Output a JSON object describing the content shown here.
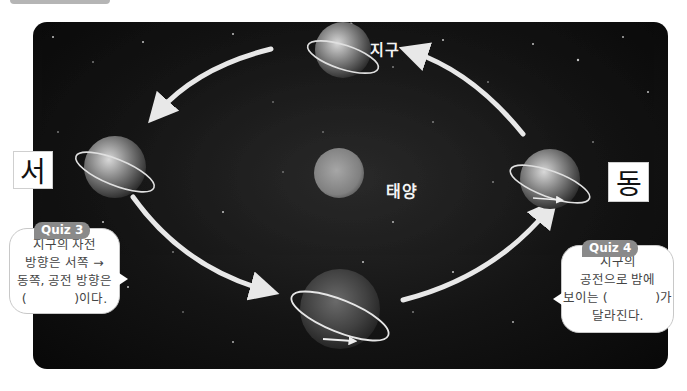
{
  "diagram": {
    "labels": {
      "earth": "지구",
      "sun": "태양",
      "west": "서",
      "east": "동"
    },
    "quiz3": {
      "badge": "Quiz 3",
      "lines": [
        "지구의 자전",
        "방향은 서쪽 →",
        "동쪽, 공전 방향은",
        "(            )이다."
      ]
    },
    "quiz4": {
      "badge": "Quiz 4",
      "lines": [
        "지구의",
        "공전으로 밤에",
        "보이는 (            )가",
        "달라진다."
      ]
    },
    "orbit_direction": "counterclockwise (as viewed: bottom → right → top → left)",
    "colors": {
      "background": "#0c0c0c",
      "arrow": "#e8e8e8",
      "badge": "#8a8a8a",
      "bubble_text": "#444444"
    }
  }
}
